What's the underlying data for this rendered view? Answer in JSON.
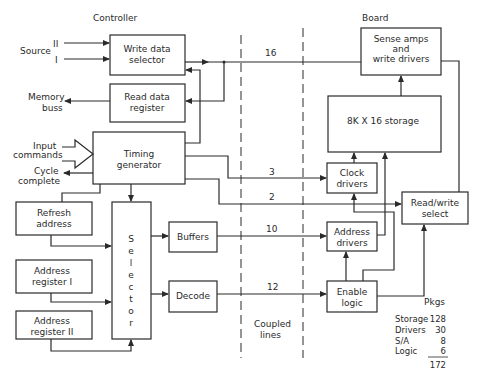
{
  "sections": {
    "controller": "Controller",
    "board": "Board",
    "coupled_line1": "Coupled",
    "coupled_line2": "lines"
  },
  "inputs": {
    "source": "Source",
    "source_ii": "II",
    "source_i": "I",
    "memory_buss_1": "Memory",
    "memory_buss_2": "buss",
    "input_commands_1": "Input",
    "input_commands_2": "commands",
    "cycle_complete_1": "Cycle",
    "cycle_complete_2": "complete"
  },
  "blocks": {
    "write_data_selector": [
      "Write data",
      "selector"
    ],
    "read_data_register": [
      "Read data",
      "register"
    ],
    "timing_generator": [
      "Timing",
      "generator"
    ],
    "refresh_address": [
      "Refresh",
      "address"
    ],
    "address_register_1": [
      "Address",
      "register  I"
    ],
    "address_register_2": [
      "Address",
      "register  II"
    ],
    "selector": [
      "S",
      "e",
      "l",
      "e",
      "c",
      "t",
      "o",
      "r"
    ],
    "buffers": "Buffers",
    "decode": "Decode",
    "sense_amps": [
      "Sense amps",
      "and",
      "write drivers"
    ],
    "storage": "8K X 16  storage",
    "clock_drivers": [
      "Clock",
      "drivers"
    ],
    "address_drivers": [
      "Address",
      "drivers"
    ],
    "enable_logic": [
      "Enable",
      "logic"
    ],
    "read_write_select": [
      "Read/write",
      "select"
    ]
  },
  "bus_widths": {
    "data": "16",
    "clock": "3",
    "rw": "2",
    "address": "10",
    "enable": "12"
  },
  "pkgs": {
    "title": "Pkgs",
    "rows": [
      {
        "label": "Storage",
        "value": "128"
      },
      {
        "label": "Drivers",
        "value": "30"
      },
      {
        "label": "S/A",
        "value": "8"
      },
      {
        "label": "Logic",
        "value": "6"
      }
    ],
    "total": "172"
  }
}
